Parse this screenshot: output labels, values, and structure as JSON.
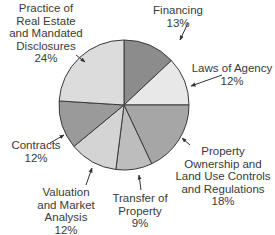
{
  "chart_data": {
    "type": "pie",
    "title": "",
    "start_angle_deg": 0,
    "direction": "clockwise",
    "center": [
      124,
      105
    ],
    "radius": 65,
    "slices": [
      {
        "label": "Financing",
        "value": 13,
        "color": "#8c8c8c",
        "label_lines": [
          "Financing",
          "13%"
        ],
        "label_pos": [
          178,
          4
        ]
      },
      {
        "label": "Laws of Agency",
        "value": 12,
        "color": "#e8e8e8",
        "label_lines": [
          "Laws of Agency",
          "12%"
        ],
        "label_pos": [
          232,
          62
        ]
      },
      {
        "label": "Property Ownership and Land Use Controls and Regulations",
        "value": 18,
        "color": "#a6a6a6",
        "label_lines": [
          "Property",
          "Ownership and",
          "Land Use Controls",
          "and Regulations",
          "18%"
        ],
        "label_pos": [
          223,
          145
        ]
      },
      {
        "label": "Transfer of Property",
        "value": 9,
        "color": "#bdbdbd",
        "label_lines": [
          "Transfer of",
          "Property",
          "9%"
        ],
        "label_pos": [
          140,
          192
        ]
      },
      {
        "label": "Valuation and Market Analysis",
        "value": 12,
        "color": "#d4d4d4",
        "label_lines": [
          "Valuation",
          "and Market",
          "Analysis",
          "12%"
        ],
        "label_pos": [
          66,
          186
        ]
      },
      {
        "label": "Contracts",
        "value": 12,
        "color": "#9a9a9a",
        "label_lines": [
          "Contracts",
          "12%"
        ],
        "label_pos": [
          36,
          139
        ]
      },
      {
        "label": "Practice of Real Estate and Mandated Disclosures",
        "value": 24,
        "color": "#dcdcdc",
        "label_lines": [
          "Practice of",
          "Real Estate",
          "and Mandated",
          "Disclosures",
          "24%"
        ],
        "label_pos": [
          46,
          2
        ]
      }
    ],
    "leaders": [
      [
        [
          188,
          23
        ],
        [
          180,
          40
        ]
      ],
      [
        [
          222,
          75
        ],
        [
          191,
          86
        ]
      ],
      [
        [
          190,
          145
        ],
        [
          182,
          138
        ]
      ],
      [
        [
          141,
          190
        ],
        [
          139,
          175
        ]
      ],
      [
        [
          86,
          185
        ],
        [
          92,
          168
        ]
      ],
      [
        [
          50,
          143
        ],
        [
          64,
          135
        ]
      ],
      [
        [
          76,
          55
        ],
        [
          85,
          62
        ]
      ]
    ],
    "legend": null
  }
}
